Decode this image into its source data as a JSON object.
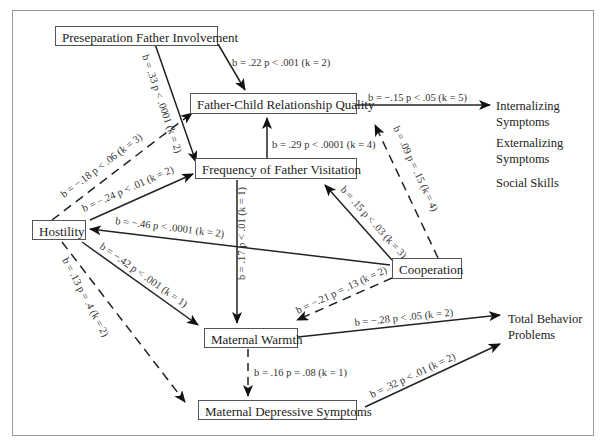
{
  "nodes": {
    "preseparation": "Preseparation Father Involvement",
    "fcrq": "Father-Child Relationship Quality",
    "visitation": "Frequency of Father Visitation",
    "hostility": "Hostility",
    "cooperation": "Cooperation",
    "warmth": "Maternal Warmth",
    "depressive": "Maternal Depressive Symptoms"
  },
  "outcomes": {
    "internalizing": [
      "Internalizing",
      "Symptoms"
    ],
    "externalizing": [
      "Externalizing",
      "Symptoms"
    ],
    "social": "Social Skills",
    "total": [
      "Total Behavior",
      "Problems"
    ]
  },
  "edges": {
    "pre_fcrq": "b = .22  p < .001 (k = 2)",
    "pre_vis": "b = .33 p < .0001 (k = 2)",
    "fcrq_int": "b = −.15  p < .05 (k = 5)",
    "vis_fcrq": "b = .29  p < .0001 (k = 4)",
    "coop_fcrq": "b = .09  p = .15 (k = 4)",
    "host_fcrq": "b = −.18  p < .06 (k = 3)",
    "host_vis": "b = −.24  p < .01 (k = 2)",
    "coop_vis": "b = .15  p < .03 (k = 3)",
    "coop_host": "b = −.46  p < .0001 (k = 2)",
    "vis_warm": "b = .17  p < .01 (k = 1)",
    "host_warm": "b = −.42  p < .001 (k = 1)",
    "coop_warm": "b = −.21  p = .13 (k = 2)",
    "host_dep": "b = .13  p = .4 (k = 2)",
    "warm_total": "b = −.28  p < .05 (k = 2)",
    "warm_dep": "b = .16  p = .08 (k = 1)",
    "dep_total": "b = .32  p < .01 (k = 2)"
  }
}
